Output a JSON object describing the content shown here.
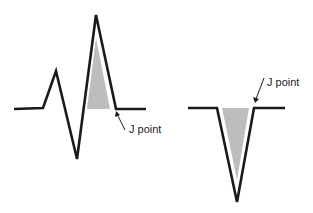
{
  "diagram": {
    "left_waveform": {
      "description": "QRS complex with positive deflection, shaded area under R wave",
      "label": "J point"
    },
    "right_waveform": {
      "description": "QS complex with negative deflection, shaded area inside",
      "label": "J point"
    },
    "colors": {
      "line": "#1a1a1a",
      "shade": "#bdbdbd",
      "background": "#ffffff"
    }
  }
}
